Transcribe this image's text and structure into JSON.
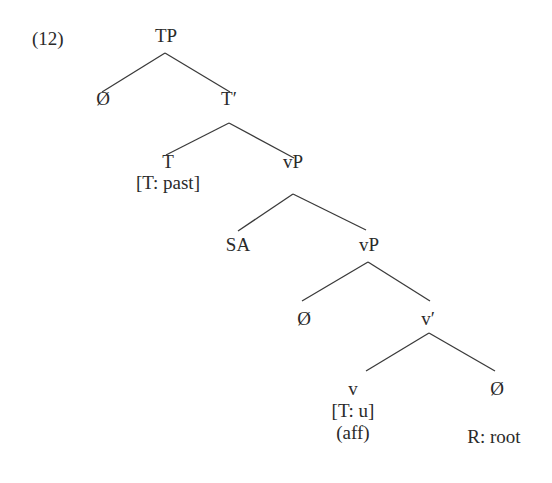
{
  "example_number": "(12)",
  "tree": {
    "nodes": [
      {
        "id": "tp",
        "label": "TP",
        "x": 166,
        "y": 25
      },
      {
        "id": "spec-tp",
        "label": "Ø",
        "x": 103,
        "y": 88
      },
      {
        "id": "t-bar",
        "label": "T′",
        "x": 229,
        "y": 88
      },
      {
        "id": "t-head",
        "label": "T",
        "x": 168,
        "y": 151
      },
      {
        "id": "t-feature",
        "label": "[T: past]",
        "x": 168,
        "y": 172
      },
      {
        "id": "vp-upper",
        "label": "vP",
        "x": 293,
        "y": 151
      },
      {
        "id": "sa",
        "label": "SA",
        "x": 238,
        "y": 234
      },
      {
        "id": "vp-lower",
        "label": "vP",
        "x": 369,
        "y": 234
      },
      {
        "id": "spec-vp",
        "label": "Ø",
        "x": 304,
        "y": 308
      },
      {
        "id": "v-bar",
        "label": "v′",
        "x": 428,
        "y": 308
      },
      {
        "id": "v-head",
        "label": "v",
        "x": 353,
        "y": 378
      },
      {
        "id": "v-feature",
        "label": "[T: u]",
        "x": 353,
        "y": 400
      },
      {
        "id": "v-aff",
        "label": "(aff)",
        "x": 353,
        "y": 422
      },
      {
        "id": "root-null",
        "label": "Ø",
        "x": 497,
        "y": 378
      },
      {
        "id": "root-label",
        "label": "R: root",
        "x": 494,
        "y": 426
      }
    ],
    "edges": [
      {
        "from": "tp",
        "to": "spec-tp",
        "x1": 165,
        "y1": 53,
        "x2": 102,
        "y2": 92
      },
      {
        "from": "tp",
        "to": "t-bar",
        "x1": 165,
        "y1": 53,
        "x2": 230,
        "y2": 92
      },
      {
        "from": "t-bar",
        "to": "t-head",
        "x1": 229,
        "y1": 123,
        "x2": 166,
        "y2": 155
      },
      {
        "from": "t-bar",
        "to": "vp-upper",
        "x1": 229,
        "y1": 123,
        "x2": 294,
        "y2": 158
      },
      {
        "from": "vp-upper",
        "to": "sa",
        "x1": 293,
        "y1": 194,
        "x2": 238,
        "y2": 231
      },
      {
        "from": "vp-upper",
        "to": "vp-lower",
        "x1": 293,
        "y1": 194,
        "x2": 366,
        "y2": 230
      },
      {
        "from": "vp-lower",
        "to": "spec-vp",
        "x1": 368,
        "y1": 262,
        "x2": 302,
        "y2": 301
      },
      {
        "from": "vp-lower",
        "to": "v-bar",
        "x1": 368,
        "y1": 262,
        "x2": 430,
        "y2": 301
      },
      {
        "from": "v-bar",
        "to": "v-head",
        "x1": 429,
        "y1": 333,
        "x2": 366,
        "y2": 371
      },
      {
        "from": "v-bar",
        "to": "root-null",
        "x1": 429,
        "y1": 333,
        "x2": 495,
        "y2": 371
      }
    ]
  }
}
